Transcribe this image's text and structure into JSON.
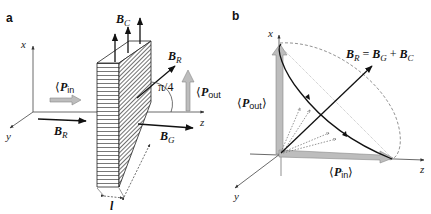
{
  "figure": {
    "panel_a": {
      "label": "a",
      "axes": {
        "x": "x",
        "y": "y",
        "z": "z"
      },
      "vectors": {
        "B_C": {
          "symbol": "B",
          "sub": "C"
        },
        "B_R_out": {
          "symbol": "B",
          "sub": "R"
        },
        "B_R_in": {
          "symbol": "B",
          "sub": "R"
        },
        "B_G": {
          "symbol": "B",
          "sub": "G"
        }
      },
      "P_in": {
        "open": "⟨",
        "symbol": "P",
        "sub": "in",
        "close": "⟩"
      },
      "P_out": {
        "open": "⟨",
        "symbol": "P",
        "sub": "out",
        "close": "⟩"
      },
      "angle": "π/4",
      "length_label": "l"
    },
    "panel_b": {
      "label": "b",
      "axes": {
        "x": "x",
        "y": "y",
        "z": "z"
      },
      "equation": {
        "lhs": "B",
        "lhs_sub": "R",
        "eq": " = ",
        "t1": "B",
        "t1_sub": "G",
        "plus": " + ",
        "t2": "B",
        "t2_sub": "C"
      },
      "P_out": {
        "open": "⟨",
        "symbol": "P",
        "sub": "out",
        "close": "⟩"
      },
      "P_in": {
        "open": "⟨",
        "symbol": "P",
        "sub": "in",
        "close": "⟩"
      }
    }
  }
}
